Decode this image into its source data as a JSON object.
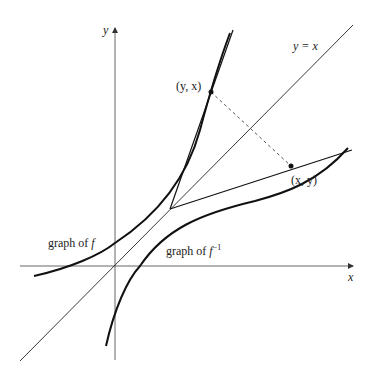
{
  "diagram": {
    "axes": {
      "x_label": "x",
      "y_label": "y"
    },
    "labels": {
      "identity_line": "y = x",
      "point_on_f": "(y, x)",
      "point_on_inverse": "(x, y)",
      "graph_f_prefix": "graph of ",
      "graph_f_symbol": "f",
      "graph_inverse_prefix": "graph of ",
      "graph_inverse_symbol": "f",
      "graph_inverse_exponent": "−1"
    },
    "colors": {
      "curve": "#111111",
      "axis": "#555555",
      "dashed": "#555555",
      "background": "#ffffff"
    }
  }
}
